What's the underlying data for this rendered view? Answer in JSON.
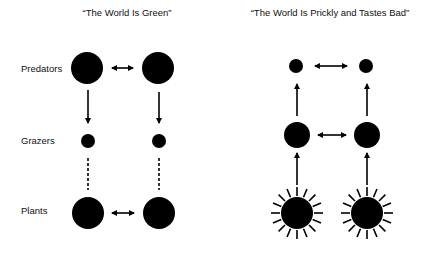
{
  "panels": {
    "left": {
      "title": "“The World Is Green”",
      "labels": {
        "predators": "Predators",
        "grazers": "Grazers",
        "plants": "Plants"
      }
    },
    "right": {
      "title": "“The World Is Prickly and Tastes Bad”"
    }
  },
  "colors": {
    "ink": "#000000",
    "background": "#ffffff"
  }
}
